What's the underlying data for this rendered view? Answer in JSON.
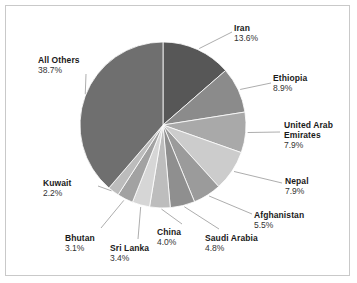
{
  "chart_data": {
    "type": "pie",
    "title": "",
    "subtitle": "",
    "xlabel": "",
    "ylabel": "",
    "legend_position": "callout-labels",
    "grid": false,
    "units": "percent",
    "start_angle_deg": 0,
    "direction": "clockwise",
    "categories": [
      "Iran",
      "Ethiopia",
      "United Arab Emirates",
      "Nepal",
      "Afghanistan",
      "Saudi Arabia",
      "China",
      "Sri Lanka",
      "Bhutan",
      "Kuwait",
      "All Others"
    ],
    "values": [
      13.6,
      8.9,
      7.9,
      7.9,
      5.5,
      4.8,
      4.0,
      3.4,
      3.1,
      2.2,
      38.7
    ],
    "slices": [
      {
        "label": "Iran",
        "value": 13.6,
        "value_text": "13.6%",
        "color": "#575757"
      },
      {
        "label": "Ethiopia",
        "value": 8.9,
        "value_text": "8.9%",
        "color": "#8b8b8b"
      },
      {
        "label": "United Arab",
        "label2": "Emirates",
        "value": 7.9,
        "value_text": "7.9%",
        "color": "#a9a9a9"
      },
      {
        "label": "Nepal",
        "value": 7.9,
        "value_text": "7.9%",
        "color": "#cccccc"
      },
      {
        "label": "Afghanistan",
        "value": 5.5,
        "value_text": "5.5%",
        "color": "#9b9b9b"
      },
      {
        "label": "Saudi Arabia",
        "value": 4.8,
        "value_text": "4.8%",
        "color": "#8f8f8f"
      },
      {
        "label": "China",
        "value": 4.0,
        "value_text": "4.0%",
        "color": "#bdbdbd"
      },
      {
        "label": "Sri Lanka",
        "value": 3.4,
        "value_text": "3.4%",
        "color": "#d6d6d6"
      },
      {
        "label": "Bhutan",
        "value": 3.1,
        "value_text": "3.1%",
        "color": "#a2a2a2"
      },
      {
        "label": "Kuwait",
        "value": 2.2,
        "value_text": "2.2%",
        "color": "#bcbcbc"
      },
      {
        "label": "All Others",
        "value": 38.7,
        "value_text": "38.7%",
        "color": "#6f6f6f"
      }
    ]
  },
  "labels": {
    "iran": {
      "name": "Iran",
      "pct": "13.6%"
    },
    "ethiopia": {
      "name": "Ethiopia",
      "pct": "8.9%"
    },
    "uae": {
      "name": "United Arab",
      "name2": "Emirates",
      "pct": "7.9%"
    },
    "nepal": {
      "name": "Nepal",
      "pct": "7.9%"
    },
    "afghanistan": {
      "name": "Afghanistan",
      "pct": "5.5%"
    },
    "saudi_arabia": {
      "name": "Saudi Arabia",
      "pct": "4.8%"
    },
    "china": {
      "name": "China",
      "pct": "4.0%"
    },
    "sri_lanka": {
      "name": "Sri Lanka",
      "pct": "3.4%"
    },
    "bhutan": {
      "name": "Bhutan",
      "pct": "3.1%"
    },
    "kuwait": {
      "name": "Kuwait",
      "pct": "2.2%"
    },
    "all_others": {
      "name": "All Others",
      "pct": "38.7%"
    }
  },
  "style": {
    "frame_color": "#c9c9c9",
    "background": "#ffffff",
    "leader_line_color": "#8a8a8a",
    "slice_edge_color": "#ffffff"
  }
}
